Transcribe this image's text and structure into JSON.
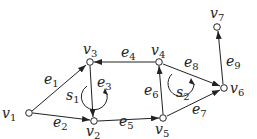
{
  "diagram": {
    "type": "directed-graph",
    "nodes": [
      {
        "id": "v1",
        "base": "v",
        "sub": "1",
        "x": 29,
        "y": 113
      },
      {
        "id": "v2",
        "base": "v",
        "sub": "2",
        "x": 94,
        "y": 121
      },
      {
        "id": "v3",
        "base": "v",
        "sub": "3",
        "x": 90,
        "y": 62
      },
      {
        "id": "v4",
        "base": "v",
        "sub": "4",
        "x": 159,
        "y": 62
      },
      {
        "id": "v5",
        "base": "v",
        "sub": "5",
        "x": 163,
        "y": 118
      },
      {
        "id": "v6",
        "base": "v",
        "sub": "6",
        "x": 224,
        "y": 88
      },
      {
        "id": "v7",
        "base": "v",
        "sub": "7",
        "x": 217,
        "y": 27
      }
    ],
    "edges": [
      {
        "id": "e1",
        "base": "e",
        "sub": "1",
        "from": "v1",
        "to": "v3"
      },
      {
        "id": "e2",
        "base": "e",
        "sub": "2",
        "from": "v1",
        "to": "v2"
      },
      {
        "id": "e3",
        "base": "e",
        "sub": "3",
        "from": "v3",
        "to": "v2"
      },
      {
        "id": "e4",
        "base": "e",
        "sub": "4",
        "from": "v4",
        "to": "v3"
      },
      {
        "id": "e5",
        "base": "e",
        "sub": "5",
        "from": "v2",
        "to": "v5"
      },
      {
        "id": "e6",
        "base": "e",
        "sub": "6",
        "from": "v5",
        "to": "v4"
      },
      {
        "id": "e7",
        "base": "e",
        "sub": "7",
        "from": "v5",
        "to": "v6"
      },
      {
        "id": "e8",
        "base": "e",
        "sub": "8",
        "from": "v4",
        "to": "v6"
      },
      {
        "id": "e9",
        "base": "e",
        "sub": "9",
        "from": "v6",
        "to": "v7"
      }
    ],
    "faces": [
      {
        "id": "s1",
        "base": "s",
        "sub": "1",
        "orientation": "counterclockwise"
      },
      {
        "id": "s2",
        "base": "s",
        "sub": "2",
        "orientation": "counterclockwise"
      }
    ],
    "colors": {
      "stroke": "#222222",
      "node_fill": "#ffffff"
    }
  }
}
